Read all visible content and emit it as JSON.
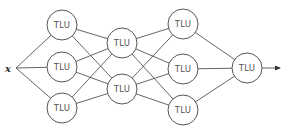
{
  "diagram": {
    "title": "",
    "input": {
      "label": "x",
      "cx": 10,
      "cy": 68
    },
    "node_label": "TLU",
    "node_radius": 15,
    "layers": [
      {
        "name": "hidden-layer-1",
        "nodes": [
          {
            "id": "h1-1",
            "label": "TLU",
            "cx": 62,
            "cy": 25
          },
          {
            "id": "h1-2",
            "label": "TLU",
            "cx": 62,
            "cy": 67
          },
          {
            "id": "h1-3",
            "label": "TLU",
            "cx": 62,
            "cy": 108
          }
        ]
      },
      {
        "name": "hidden-layer-2",
        "nodes": [
          {
            "id": "h2-1",
            "label": "TLU",
            "cx": 122,
            "cy": 43
          },
          {
            "id": "h2-2",
            "label": "TLU",
            "cx": 122,
            "cy": 89
          }
        ]
      },
      {
        "name": "hidden-layer-3",
        "nodes": [
          {
            "id": "h3-1",
            "label": "TLU",
            "cx": 183,
            "cy": 24
          },
          {
            "id": "h3-2",
            "label": "TLU",
            "cx": 183,
            "cy": 69
          },
          {
            "id": "h3-3",
            "label": "TLU",
            "cx": 183,
            "cy": 110
          }
        ]
      },
      {
        "name": "output-layer",
        "nodes": [
          {
            "id": "out",
            "label": "TLU",
            "cx": 247,
            "cy": 68
          }
        ]
      }
    ],
    "output_arrow": {
      "x1": 262,
      "y1": 68,
      "x2": 280,
      "y2": 68
    },
    "connectivity": "fully-connected between adjacent layers",
    "colors": {
      "stroke": "#555555",
      "text": "#555555",
      "background": "#ffffff"
    }
  }
}
